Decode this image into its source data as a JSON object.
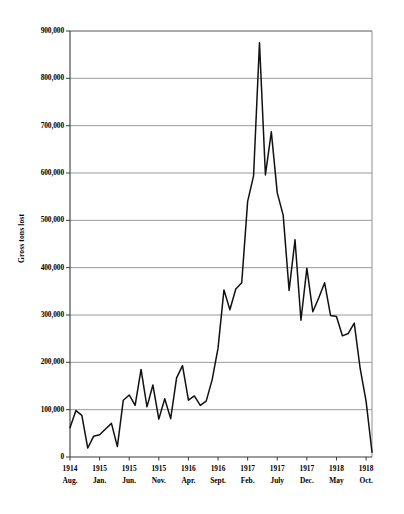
{
  "chart_data": {
    "type": "line",
    "title": "",
    "subtitle": "",
    "xlabel": "",
    "ylabel": "Gross tons lost",
    "ylim": [
      0,
      900000
    ],
    "xlim": [
      "1914 Aug.",
      "1918 Nov."
    ],
    "grid": true,
    "legend": null,
    "y_ticks": [
      "0",
      "100,000",
      "200,000",
      "300,000",
      "400,000",
      "500,000",
      "600,000",
      "700,000",
      "800,000",
      "900,000"
    ],
    "y_tick_values": [
      0,
      100000,
      200000,
      300000,
      400000,
      500000,
      600000,
      700000,
      800000,
      900000
    ],
    "x_ticks": [
      {
        "year": "1914",
        "month": "Aug."
      },
      {
        "year": "1915",
        "month": "Jan."
      },
      {
        "year": "1915",
        "month": "Jun."
      },
      {
        "year": "1915",
        "month": "Nov."
      },
      {
        "year": "1916",
        "month": "Apr."
      },
      {
        "year": "1916",
        "month": "Sept."
      },
      {
        "year": "1917",
        "month": "Feb."
      },
      {
        "year": "1917",
        "month": "July"
      },
      {
        "year": "1917",
        "month": "Dec."
      },
      {
        "year": "1918",
        "month": "May"
      },
      {
        "year": "1918",
        "month": "Oct."
      }
    ],
    "x_labels": [
      "1914 Aug.",
      "1914 Sept.",
      "1914 Oct.",
      "1914 Nov.",
      "1914 Dec.",
      "1915 Jan.",
      "1915 Feb.",
      "1915 Mar.",
      "1915 Apr.",
      "1915 May",
      "1915 Jun.",
      "1915 Jul.",
      "1915 Aug.",
      "1915 Sept.",
      "1915 Oct.",
      "1915 Nov.",
      "1915 Dec.",
      "1916 Jan.",
      "1916 Feb.",
      "1916 Mar.",
      "1916 Apr.",
      "1916 May",
      "1916 Jun.",
      "1916 Jul.",
      "1916 Aug.",
      "1916 Sept.",
      "1916 Oct.",
      "1916 Nov.",
      "1916 Dec.",
      "1917 Jan.",
      "1917 Feb.",
      "1917 Mar.",
      "1917 Apr.",
      "1917 May",
      "1917 Jun.",
      "1917 Jul.",
      "1917 Aug.",
      "1917 Sept.",
      "1917 Oct.",
      "1917 Nov.",
      "1917 Dec.",
      "1918 Jan.",
      "1918 Feb.",
      "1918 Mar.",
      "1918 Apr.",
      "1918 May",
      "1918 Jun.",
      "1918 Jul.",
      "1918 Aug.",
      "1918 Sept.",
      "1918 Oct.",
      "1918 Nov."
    ],
    "values": [
      62000,
      98000,
      88000,
      19000,
      44000,
      47000,
      59000,
      71000,
      22000,
      120000,
      131000,
      109000,
      185000,
      106000,
      152000,
      80000,
      123000,
      81000,
      167000,
      193000,
      120000,
      129000,
      109000,
      118000,
      163000,
      230000,
      353000,
      311000,
      355000,
      368000,
      540000,
      594000,
      875000,
      596000,
      687000,
      558000,
      511000,
      352000,
      459000,
      289000,
      399000,
      307000,
      336000,
      368000,
      299000,
      297000,
      256000,
      261000,
      283000,
      187000,
      118000,
      10000
    ],
    "series_color": "#111111",
    "grid_color": "#9a9a9a",
    "axis_color": "#555555",
    "plot_bg": "#ffffff",
    "peak": {
      "label": "1917 Apr.",
      "value": 875000
    },
    "minimum": {
      "label": "1918 Nov.",
      "value": 10000
    },
    "units": "Gross tons lost",
    "point_count": 52
  },
  "layout": {
    "plot_left": 70,
    "plot_right": 372,
    "plot_top": 31,
    "plot_bottom": 457
  }
}
